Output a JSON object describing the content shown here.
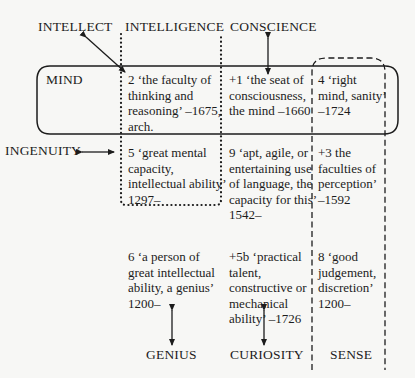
{
  "top_labels": {
    "intellect": "INTELLECT",
    "intelligence": "INTELLIGENCE",
    "conscience": "CONSCIENCE"
  },
  "side_labels": {
    "mind": "MIND",
    "ingenuity": "INGENUITY"
  },
  "bottom_labels": {
    "genius": "GENIUS",
    "curiosity": "CURIOSITY",
    "sense": "SENSE"
  },
  "senses": {
    "row1": [
      {
        "text": "2  ‘the faculty of\nthinking and\nreasoning’ –1675,\narch."
      },
      {
        "text": "+1  ‘the seat of\nconsciousness,\nthe mind –1660"
      },
      {
        "text": "4  ‘right\nmind, sanity’\n–1724"
      }
    ],
    "row2": [
      {
        "text": "5  ‘great mental\ncapacity,\nintellectual ability’\n1297–"
      },
      {
        "text": "9  ‘apt, agile, or\nentertaining use\nof language, the\ncapacity for this’\n1542–"
      },
      {
        "text": "+3  the\nfaculties of\nperception’\n–1592"
      }
    ],
    "row3": [
      {
        "text": "6  ‘a person of\ngreat intellectual\nability, a genius’\n1200–"
      },
      {
        "text": "+5b  ‘practical\ntalent,\nconstructive or\nmechanical\nability’ –1726"
      },
      {
        "text": "8  ‘good\njudgement,\ndiscretion’\n1200–"
      }
    ]
  },
  "colors": {
    "ink": "#1c1c1c",
    "background": "#f7f7f5"
  }
}
